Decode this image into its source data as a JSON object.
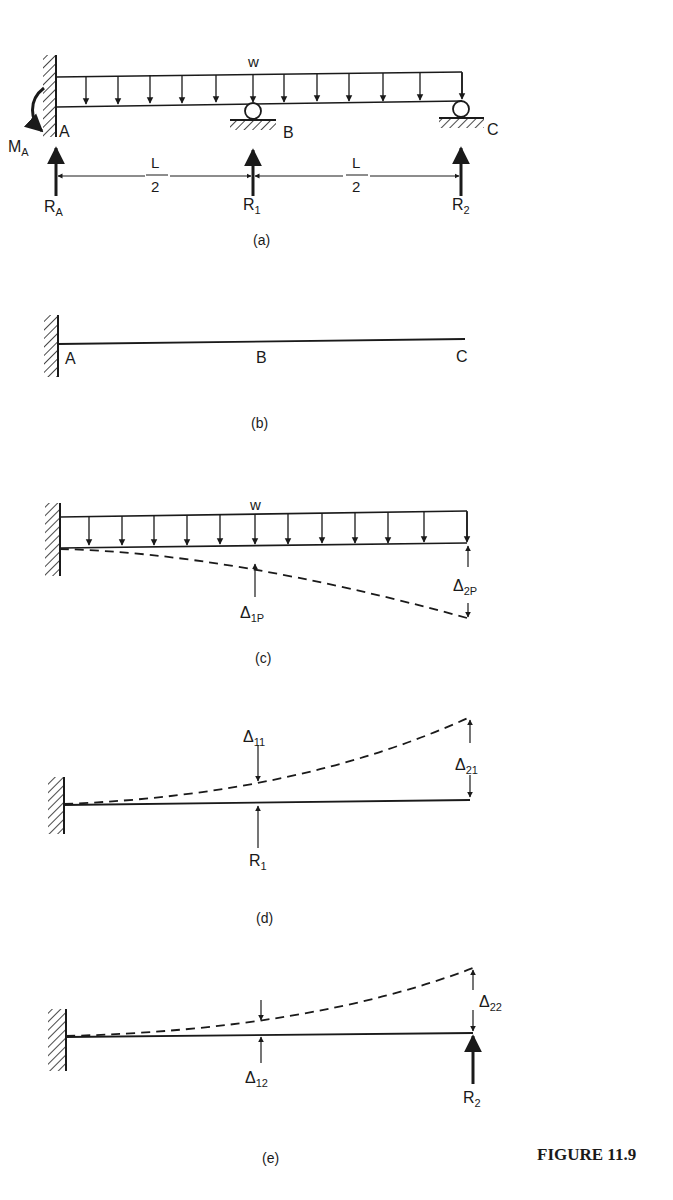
{
  "figure": {
    "caption": "FIGURE 11.9",
    "panels": [
      {
        "id": "a",
        "label": "(a)",
        "load_label": "w",
        "points": [
          "A",
          "B",
          "C"
        ],
        "moment_label": "M",
        "moment_sub": "A",
        "reactions": [
          {
            "main": "R",
            "sub": "A"
          },
          {
            "main": "R",
            "sub": "1"
          },
          {
            "main": "R",
            "sub": "2"
          }
        ],
        "spans": [
          {
            "num": "L",
            "den": "2"
          },
          {
            "num": "L",
            "den": "2"
          }
        ]
      },
      {
        "id": "b",
        "label": "(b)",
        "points": [
          "A",
          "B",
          "C"
        ]
      },
      {
        "id": "c",
        "label": "(c)",
        "load_label": "w",
        "deflections": [
          {
            "main": "Δ",
            "sub": "1P"
          },
          {
            "main": "Δ",
            "sub": "2P"
          }
        ]
      },
      {
        "id": "d",
        "label": "(d)",
        "deflections": [
          {
            "main": "Δ",
            "sub": "11"
          },
          {
            "main": "Δ",
            "sub": "21"
          }
        ],
        "reaction": {
          "main": "R",
          "sub": "1"
        }
      },
      {
        "id": "e",
        "label": "(e)",
        "deflections": [
          {
            "main": "Δ",
            "sub": "12"
          },
          {
            "main": "Δ",
            "sub": "22"
          }
        ],
        "reaction": {
          "main": "R",
          "sub": "2"
        }
      }
    ]
  },
  "colors": {
    "ink": "#1a1a1a",
    "background": "#ffffff"
  }
}
